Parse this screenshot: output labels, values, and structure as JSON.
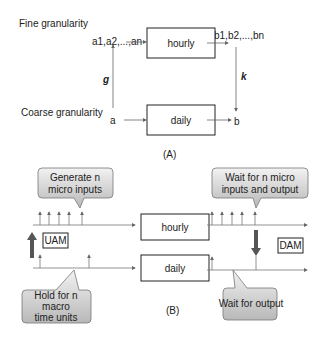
{
  "part_a": {
    "label": "(A)",
    "fine_label": "Fine granularity",
    "coarse_label": "Coarse granularity",
    "fine_input": "a1,a2,...,an",
    "fine_output": "b1,b2,...,bn",
    "coarse_input": "a",
    "coarse_output": "b",
    "hourly_box": "hourly",
    "daily_box": "daily",
    "g_label": "g",
    "k_label": "k"
  },
  "part_b": {
    "label": "(B)",
    "hourly_box": "hourly",
    "daily_box": "daily",
    "uam_label": "UAM",
    "dam_label": "DAM",
    "callout_generate": [
      "Generate n",
      "micro inputs"
    ],
    "callout_hold": [
      "Hold for n",
      "macro",
      "time units"
    ],
    "callout_wait_micro": [
      "Wait for n micro",
      "inputs and output"
    ],
    "callout_wait_output": "Wait for output",
    "colors": {
      "arrow": "#555555",
      "callout_top": "#eeeeee",
      "callout_bottom": "#bbbbbb"
    }
  }
}
